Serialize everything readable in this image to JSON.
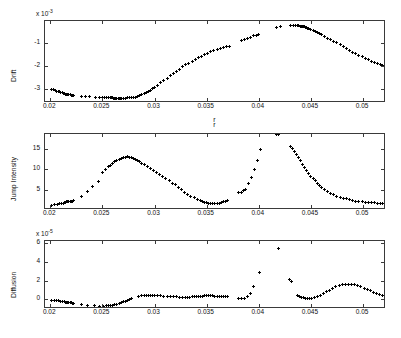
{
  "figure": {
    "width": 401,
    "height": 338,
    "background": "#ffffff",
    "marker_color": "#000000",
    "axis_color": "#3a3a3a",
    "marker_symbol": "plus"
  },
  "chart_data": [
    {
      "type": "scatter",
      "name": "drift-panel",
      "title": "",
      "xlabel": "r",
      "ylabel": "Drift",
      "exponent_label": "x 10",
      "exponent_value": "-3",
      "y_scale_factor": 0.001,
      "xlim": [
        0.0195,
        0.0522
      ],
      "ylim": [
        -3.62,
        -0.05
      ],
      "xticks": [
        0.02,
        0.025,
        0.03,
        0.035,
        0.04,
        0.045,
        0.05
      ],
      "xticklabels": [
        "0.02",
        "0.025",
        "0.03",
        "0.035",
        "0.04",
        "0.045",
        "0.05"
      ],
      "yticks": [
        -1,
        -2,
        -3
      ],
      "yticklabels": [
        "-1",
        "-2",
        "-3"
      ],
      "grid": false,
      "legend": false,
      "x": [
        0.0201,
        0.0203,
        0.0205,
        0.0206,
        0.0208,
        0.0209,
        0.021,
        0.0212,
        0.0213,
        0.0214,
        0.0215,
        0.0216,
        0.0217,
        0.0218,
        0.0219,
        0.022,
        0.0221,
        0.0222,
        0.023,
        0.0234,
        0.0238,
        0.0243,
        0.0247,
        0.025,
        0.0252,
        0.0254,
        0.0256,
        0.0258,
        0.0259,
        0.026,
        0.0261,
        0.0262,
        0.0263,
        0.0264,
        0.0265,
        0.0266,
        0.0267,
        0.0268,
        0.027,
        0.0272,
        0.0274,
        0.0276,
        0.0278,
        0.028,
        0.0282,
        0.0284,
        0.0286,
        0.0288,
        0.029,
        0.0292,
        0.0294,
        0.0296,
        0.0298,
        0.03,
        0.0303,
        0.0306,
        0.0309,
        0.0312,
        0.0315,
        0.0318,
        0.0321,
        0.0324,
        0.0327,
        0.033,
        0.0333,
        0.0336,
        0.0339,
        0.0342,
        0.0345,
        0.0348,
        0.0351,
        0.0354,
        0.0357,
        0.036,
        0.0363,
        0.0366,
        0.0369,
        0.0372,
        0.0383,
        0.0386,
        0.0389,
        0.0392,
        0.0395,
        0.0398,
        0.04,
        0.0417,
        0.0421,
        0.043,
        0.0433,
        0.0435,
        0.0437,
        0.0438,
        0.044,
        0.0441,
        0.0442,
        0.0443,
        0.0444,
        0.0445,
        0.0446,
        0.0447,
        0.0448,
        0.045,
        0.0452,
        0.0454,
        0.0456,
        0.0458,
        0.046,
        0.0463,
        0.0466,
        0.0469,
        0.0472,
        0.0475,
        0.0478,
        0.0481,
        0.0484,
        0.0487,
        0.049,
        0.0493,
        0.0496,
        0.0499,
        0.0502,
        0.0505,
        0.0508,
        0.0511,
        0.0514,
        0.0517,
        0.0519
      ],
      "y": [
        -3.02,
        -3.05,
        -3.08,
        -3.1,
        -3.12,
        -3.14,
        -3.16,
        -3.18,
        -3.2,
        -3.22,
        -3.23,
        -3.24,
        -3.25,
        -3.26,
        -3.27,
        -3.28,
        -3.29,
        -3.3,
        -3.33,
        -3.34,
        -3.35,
        -3.36,
        -3.37,
        -3.38,
        -3.38,
        -3.39,
        -3.39,
        -3.4,
        -3.4,
        -3.4,
        -3.41,
        -3.41,
        -3.41,
        -3.41,
        -3.41,
        -3.41,
        -3.41,
        -3.41,
        -3.41,
        -3.41,
        -3.4,
        -3.4,
        -3.39,
        -3.38,
        -3.36,
        -3.33,
        -3.3,
        -3.26,
        -3.22,
        -3.17,
        -3.12,
        -3.06,
        -3.0,
        -2.94,
        -2.84,
        -2.74,
        -2.64,
        -2.54,
        -2.44,
        -2.34,
        -2.24,
        -2.14,
        -2.05,
        -1.96,
        -1.88,
        -1.8,
        -1.72,
        -1.65,
        -1.58,
        -1.51,
        -1.45,
        -1.39,
        -1.34,
        -1.29,
        -1.25,
        -1.21,
        -1.18,
        -1.15,
        -0.9,
        -0.85,
        -0.8,
        -0.75,
        -0.7,
        -0.66,
        -0.63,
        -0.33,
        -0.3,
        -0.25,
        -0.24,
        -0.24,
        -0.25,
        -0.26,
        -0.27,
        -0.28,
        -0.29,
        -0.3,
        -0.31,
        -0.32,
        -0.34,
        -0.36,
        -0.38,
        -0.42,
        -0.46,
        -0.5,
        -0.55,
        -0.6,
        -0.65,
        -0.72,
        -0.79,
        -0.86,
        -0.93,
        -1.0,
        -1.08,
        -1.16,
        -1.24,
        -1.32,
        -1.4,
        -1.47,
        -1.54,
        -1.61,
        -1.68,
        -1.74,
        -1.8,
        -1.85,
        -1.9,
        -1.94,
        -1.97
      ]
    },
    {
      "type": "scatter",
      "name": "jump-intensity-panel",
      "title": "",
      "xlabel": "r",
      "ylabel": "Jump Intensity",
      "exponent_label": "",
      "exponent_value": "",
      "y_scale_factor": 1,
      "xlim": [
        0.0195,
        0.0522
      ],
      "ylim": [
        0.0,
        18.6
      ],
      "xticks": [
        0.02,
        0.025,
        0.03,
        0.035,
        0.04,
        0.045,
        0.05
      ],
      "xticklabels": [
        "0.02",
        "0.025",
        "0.03",
        "0.035",
        "0.04",
        "0.045",
        "0.05"
      ],
      "yticks": [
        5,
        10,
        15
      ],
      "yticklabels": [
        "5",
        "10",
        "15"
      ],
      "grid": false,
      "legend": false,
      "x": [
        0.0201,
        0.0204,
        0.0207,
        0.0209,
        0.0211,
        0.0213,
        0.0214,
        0.0215,
        0.0216,
        0.0217,
        0.0218,
        0.0219,
        0.022,
        0.0221,
        0.0222,
        0.023,
        0.0236,
        0.0241,
        0.0246,
        0.025,
        0.0253,
        0.0256,
        0.0258,
        0.026,
        0.0262,
        0.0264,
        0.0266,
        0.0268,
        0.027,
        0.0272,
        0.0274,
        0.0276,
        0.0278,
        0.028,
        0.0282,
        0.0284,
        0.0286,
        0.0288,
        0.029,
        0.0293,
        0.0296,
        0.0299,
        0.0302,
        0.0305,
        0.0308,
        0.0311,
        0.0314,
        0.0317,
        0.032,
        0.0323,
        0.0326,
        0.0329,
        0.0332,
        0.0335,
        0.0338,
        0.0341,
        0.0344,
        0.0346,
        0.0348,
        0.035,
        0.0352,
        0.0354,
        0.0356,
        0.0358,
        0.036,
        0.0362,
        0.0364,
        0.0366,
        0.0368,
        0.037,
        0.0381,
        0.0383,
        0.0385,
        0.0387,
        0.039,
        0.0393,
        0.0396,
        0.0399,
        0.0402,
        0.0417,
        0.0419,
        0.043,
        0.0432,
        0.0434,
        0.0436,
        0.0438,
        0.044,
        0.0442,
        0.0444,
        0.0446,
        0.0448,
        0.045,
        0.0452,
        0.0454,
        0.0456,
        0.0458,
        0.046,
        0.0463,
        0.0466,
        0.0469,
        0.0472,
        0.0475,
        0.0478,
        0.0481,
        0.0484,
        0.0487,
        0.049,
        0.0493,
        0.0496,
        0.0499,
        0.0502,
        0.0505,
        0.0508,
        0.0511,
        0.0514,
        0.0517,
        0.0519
      ],
      "y": [
        1.2,
        1.3,
        1.4,
        1.5,
        1.6,
        1.7,
        1.8,
        1.9,
        2.0,
        2.0,
        2.1,
        2.1,
        2.2,
        2.2,
        2.3,
        3.3,
        4.5,
        5.8,
        6.9,
        9.2,
        9.9,
        10.6,
        11.0,
        11.4,
        11.8,
        12.1,
        12.4,
        12.6,
        12.8,
        12.9,
        13.0,
        12.9,
        12.8,
        12.6,
        12.4,
        12.1,
        11.8,
        11.4,
        11.1,
        10.6,
        10.1,
        9.6,
        9.1,
        8.6,
        8.1,
        7.6,
        7.1,
        6.6,
        6.2,
        5.6,
        5.0,
        4.4,
        3.9,
        3.4,
        3.0,
        2.6,
        2.3,
        2.1,
        1.9,
        1.8,
        1.7,
        1.6,
        1.6,
        1.6,
        1.6,
        1.7,
        1.8,
        2.0,
        2.2,
        2.4,
        4.2,
        4.4,
        4.7,
        5.0,
        6.5,
        8.0,
        9.8,
        12.2,
        14.7,
        18.5,
        18.6,
        15.5,
        15.0,
        14.2,
        13.5,
        12.8,
        12.0,
        11.2,
        10.4,
        9.7,
        9.0,
        8.3,
        7.7,
        7.1,
        6.5,
        6.0,
        5.5,
        5.0,
        4.5,
        4.1,
        3.7,
        3.4,
        3.1,
        2.9,
        2.7,
        2.5,
        2.4,
        2.2,
        2.1,
        2.0,
        1.9,
        1.9,
        1.8,
        1.8,
        1.7,
        1.7,
        1.7
      ]
    },
    {
      "type": "scatter",
      "name": "diffusion-panel",
      "title": "",
      "xlabel": "r",
      "ylabel": "Diffusion",
      "exponent_label": "x 10",
      "exponent_value": "-5",
      "y_scale_factor": 1e-05,
      "xlim": [
        0.0195,
        0.0522
      ],
      "ylim": [
        -1.05,
        6.25
      ],
      "xticks": [
        0.02,
        0.025,
        0.03,
        0.035,
        0.04,
        0.045,
        0.05
      ],
      "xticklabels": [
        "0.02",
        "0.025",
        "0.03",
        "0.035",
        "0.04",
        "0.045",
        "0.05"
      ],
      "yticks": [
        0,
        2,
        4,
        6
      ],
      "yticklabels": [
        "0",
        "2",
        "4",
        "6"
      ],
      "grid": false,
      "legend": false,
      "x": [
        0.0201,
        0.0204,
        0.0206,
        0.0208,
        0.021,
        0.0212,
        0.0214,
        0.0215,
        0.0216,
        0.0217,
        0.0218,
        0.0219,
        0.022,
        0.0221,
        0.0222,
        0.023,
        0.0236,
        0.0242,
        0.0247,
        0.0251,
        0.0254,
        0.0256,
        0.0258,
        0.026,
        0.0262,
        0.0264,
        0.0266,
        0.0268,
        0.027,
        0.0272,
        0.0274,
        0.0276,
        0.0278,
        0.0285,
        0.0288,
        0.029,
        0.0292,
        0.0294,
        0.0296,
        0.0298,
        0.03,
        0.0303,
        0.0306,
        0.0309,
        0.0312,
        0.0315,
        0.0318,
        0.0321,
        0.0324,
        0.0327,
        0.033,
        0.0332,
        0.0334,
        0.0336,
        0.0338,
        0.034,
        0.0342,
        0.0344,
        0.0346,
        0.0348,
        0.035,
        0.0352,
        0.0354,
        0.0356,
        0.0358,
        0.036,
        0.0362,
        0.0364,
        0.0366,
        0.0368,
        0.037,
        0.0381,
        0.0383,
        0.0386,
        0.0389,
        0.0392,
        0.0395,
        0.0401,
        0.0419,
        0.0429,
        0.0431,
        0.0437,
        0.0439,
        0.0441,
        0.0443,
        0.0445,
        0.0447,
        0.0449,
        0.0451,
        0.0453,
        0.0456,
        0.0459,
        0.0462,
        0.0465,
        0.0468,
        0.0471,
        0.0474,
        0.0477,
        0.048,
        0.0483,
        0.0486,
        0.0489,
        0.0492,
        0.0495,
        0.0498,
        0.0501,
        0.0504,
        0.0507,
        0.051,
        0.0513,
        0.0516,
        0.0519
      ],
      "y": [
        -0.1,
        -0.13,
        -0.16,
        -0.19,
        -0.22,
        -0.25,
        -0.28,
        -0.3,
        -0.32,
        -0.34,
        -0.36,
        -0.38,
        -0.4,
        -0.42,
        -0.44,
        -0.58,
        -0.66,
        -0.72,
        -0.74,
        -0.74,
        -0.72,
        -0.7,
        -0.67,
        -0.63,
        -0.58,
        -0.52,
        -0.45,
        -0.37,
        -0.29,
        -0.21,
        -0.13,
        -0.05,
        0.03,
        0.32,
        0.38,
        0.41,
        0.43,
        0.44,
        0.44,
        0.43,
        0.42,
        0.4,
        0.37,
        0.34,
        0.31,
        0.28,
        0.26,
        0.24,
        0.23,
        0.22,
        0.22,
        0.22,
        0.23,
        0.24,
        0.26,
        0.28,
        0.3,
        0.32,
        0.34,
        0.35,
        0.36,
        0.36,
        0.36,
        0.35,
        0.34,
        0.32,
        0.31,
        0.29,
        0.28,
        0.27,
        0.26,
        0.05,
        0.07,
        0.12,
        0.25,
        0.6,
        1.4,
        2.9,
        5.4,
        2.1,
        1.9,
        0.35,
        0.28,
        0.22,
        0.16,
        0.12,
        0.09,
        0.08,
        0.1,
        0.14,
        0.25,
        0.4,
        0.58,
        0.78,
        0.98,
        1.16,
        1.32,
        1.44,
        1.53,
        1.58,
        1.6,
        1.58,
        1.53,
        1.45,
        1.34,
        1.2,
        1.05,
        0.9,
        0.76,
        0.63,
        0.52,
        0.44
      ]
    }
  ]
}
